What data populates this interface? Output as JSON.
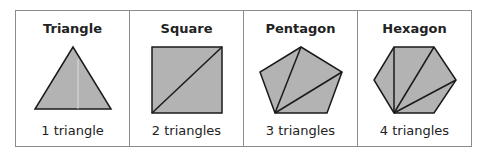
{
  "table": {
    "columns": [
      {
        "title": "Triangle",
        "caption": "1 triangle",
        "shape": "triangle-icon",
        "triangles": 1
      },
      {
        "title": "Square",
        "caption": "2 triangles",
        "shape": "square-icon",
        "triangles": 2
      },
      {
        "title": "Pentagon",
        "caption": "3 triangles",
        "shape": "pentagon-icon",
        "triangles": 3
      },
      {
        "title": "Hexagon",
        "caption": "4 triangles",
        "shape": "hexagon-icon",
        "triangles": 4
      }
    ]
  },
  "colors": {
    "fill": "#b3b3b3",
    "stroke": "#1a1a1a",
    "border": "#8c8c8c"
  }
}
